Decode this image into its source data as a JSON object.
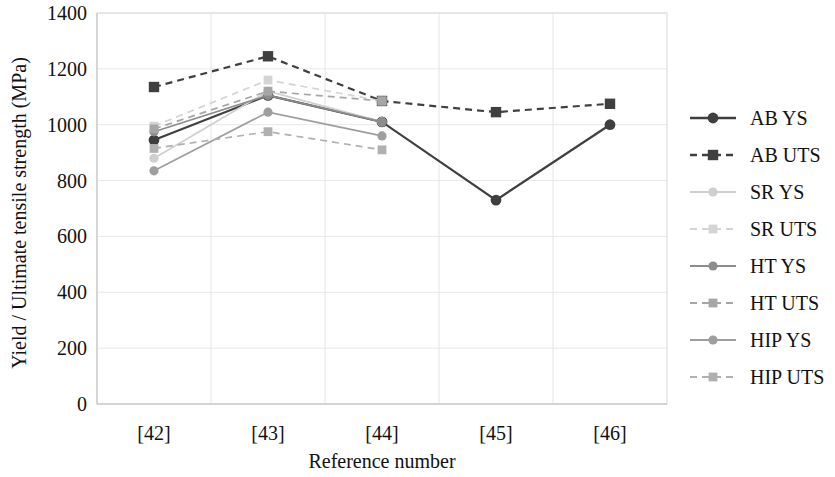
{
  "chart_data": {
    "type": "line",
    "title": "",
    "xlabel": "Reference number",
    "ylabel": "Yield / Ultimate tensile strength (MPa)",
    "categories": [
      "[42]",
      "[43]",
      "[44]",
      "[45]",
      "[46]"
    ],
    "ylim": [
      0,
      1400
    ],
    "yticks": [
      0,
      200,
      400,
      600,
      800,
      1000,
      1200,
      1400
    ],
    "ytick_labels": [
      "0",
      "200",
      "400",
      "600",
      "800",
      "1000",
      "1200",
      "1400"
    ],
    "grid": true,
    "legend_position": "right",
    "series": [
      {
        "name": "AB YS",
        "color": "#3f3f3f",
        "style": "solid",
        "marker": "circle",
        "values": [
          945,
          1105,
          1010,
          730,
          1000
        ]
      },
      {
        "name": "AB UTS",
        "color": "#3f3f3f",
        "style": "dashed",
        "marker": "square",
        "values": [
          1135,
          1245,
          1085,
          1045,
          1075
        ]
      },
      {
        "name": "SR YS",
        "color": "#cfcfcf",
        "style": "solid",
        "marker": "circle",
        "values": [
          880,
          1120,
          1010,
          null,
          null
        ]
      },
      {
        "name": "SR UTS",
        "color": "#d4d4d4",
        "style": "dashed",
        "marker": "square",
        "values": [
          995,
          1160,
          1085,
          null,
          null
        ]
      },
      {
        "name": "HT YS",
        "color": "#8c8c8c",
        "style": "solid",
        "marker": "circle",
        "values": [
          975,
          1105,
          1010,
          null,
          null
        ]
      },
      {
        "name": "HT UTS",
        "color": "#a6a6a6",
        "style": "dashed",
        "marker": "square",
        "values": [
          985,
          1120,
          1085,
          null,
          null
        ]
      },
      {
        "name": "HIP YS",
        "color": "#9e9e9e",
        "style": "solid",
        "marker": "circle",
        "values": [
          835,
          1045,
          960,
          null,
          null
        ]
      },
      {
        "name": "HIP UTS",
        "color": "#b0b0b0",
        "style": "dashed",
        "marker": "square",
        "values": [
          915,
          975,
          910,
          null,
          null
        ]
      }
    ]
  }
}
